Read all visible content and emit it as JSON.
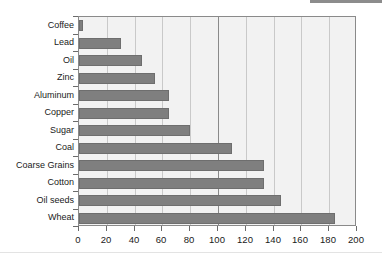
{
  "chart_data": {
    "type": "bar",
    "orientation": "horizontal",
    "title": "",
    "subtitle": "",
    "xlabel": "",
    "ylabel": "",
    "xlim": [
      0,
      200
    ],
    "ylim": null,
    "grid": true,
    "legend": null,
    "legend_position": "none",
    "annotations": [],
    "xticks": [
      0,
      20,
      40,
      60,
      80,
      100,
      120,
      140,
      160,
      180,
      200
    ],
    "xtick_labels": [
      "0",
      "20",
      "40",
      "60",
      "80",
      "100",
      "120",
      "140",
      "160",
      "180",
      "200"
    ],
    "major_gridline_at": 100,
    "categories": [
      "Coffee",
      "Lead",
      "Oil",
      "Zinc",
      "Aluminum",
      "Copper",
      "Sugar",
      "Coal",
      "Coarse Grains",
      "Cotton",
      "Oil seeds",
      "Wheat"
    ],
    "values": [
      3,
      30,
      45,
      55,
      65,
      65,
      80,
      110,
      133,
      133,
      145,
      184
    ],
    "series": [
      {
        "name": "",
        "values": [
          3,
          30,
          45,
          55,
          65,
          65,
          80,
          110,
          133,
          133,
          145,
          184
        ]
      }
    ],
    "colors": {
      "bar": "#7f7f7f",
      "bar_border": "#6e6e6e",
      "plot_background": "#f2f2f2",
      "plot_border": "#8a8a8a",
      "gridline": "#c9c9c9",
      "gridline_major": "#8a8a8a",
      "tick_label": "#1a1a1a",
      "page_background": "#ffffff"
    }
  }
}
